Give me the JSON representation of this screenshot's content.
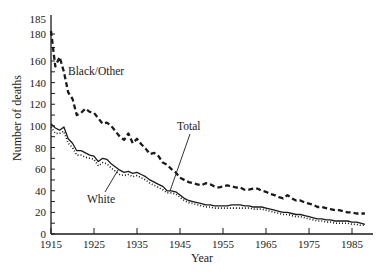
{
  "chart_data": {
    "type": "line",
    "title": "",
    "xlabel": "Year",
    "ylabel": "Number of deaths",
    "xlim": [
      1915,
      1990
    ],
    "ylim": [
      0,
      185
    ],
    "x_ticks": [
      1915,
      1925,
      1935,
      1945,
      1955,
      1965,
      1975,
      1985
    ],
    "y_ticks": [
      0,
      20,
      40,
      60,
      80,
      100,
      120,
      140,
      160,
      180,
      185
    ],
    "y_minor_step": 10,
    "grid": false,
    "legend": "none (series labelled directly)",
    "x": [
      1915,
      1916,
      1917,
      1918,
      1919,
      1920,
      1921,
      1922,
      1923,
      1924,
      1925,
      1926,
      1927,
      1928,
      1929,
      1930,
      1931,
      1932,
      1933,
      1934,
      1935,
      1936,
      1937,
      1938,
      1939,
      1940,
      1941,
      1942,
      1943,
      1944,
      1945,
      1946,
      1947,
      1948,
      1949,
      1950,
      1951,
      1952,
      1953,
      1954,
      1955,
      1956,
      1957,
      1958,
      1959,
      1960,
      1961,
      1962,
      1963,
      1964,
      1965,
      1966,
      1967,
      1968,
      1969,
      1970,
      1971,
      1972,
      1973,
      1974,
      1975,
      1976,
      1977,
      1978,
      1979,
      1980,
      1981,
      1982,
      1983,
      1984,
      1985,
      1986,
      1987,
      1988
    ],
    "series": [
      {
        "name": "Black/Other",
        "style": "dashed",
        "values": [
          181,
          155,
          163,
          150,
          131,
          125,
          110,
          112,
          116,
          113,
          112,
          107,
          102,
          103,
          100,
          95,
          90,
          87,
          93,
          84,
          88,
          83,
          79,
          74,
          75,
          72,
          66,
          64,
          60,
          57,
          52,
          50,
          48,
          47,
          46,
          45,
          47,
          46,
          44,
          43,
          44,
          45,
          44,
          43,
          43,
          41,
          41,
          42,
          42,
          40,
          39,
          37,
          36,
          34,
          33,
          36,
          33,
          31,
          31,
          29,
          28,
          27,
          25,
          25,
          24,
          23,
          22,
          22,
          21,
          20,
          20,
          19,
          19,
          19
        ]
      },
      {
        "name": "Total",
        "style": "solid",
        "values": [
          102,
          98,
          96,
          99,
          88,
          84,
          77,
          77,
          75,
          73,
          72,
          67,
          70,
          69,
          65,
          62,
          59,
          57,
          58,
          56,
          57,
          55,
          53,
          50,
          48,
          46,
          44,
          40,
          40,
          39,
          36,
          33,
          31,
          30,
          29,
          28,
          27,
          27,
          26,
          26,
          26,
          26,
          27,
          27,
          27,
          26,
          26,
          25,
          25,
          25,
          24,
          23,
          22,
          21,
          20,
          20,
          19,
          18,
          18,
          17,
          16,
          15,
          14,
          14,
          13,
          13,
          12,
          12,
          12,
          12,
          11,
          11,
          10,
          9
        ]
      },
      {
        "name": "White",
        "style": "dotted",
        "values": [
          99,
          93,
          93,
          95,
          84,
          80,
          73,
          73,
          71,
          70,
          69,
          63,
          66,
          65,
          61,
          58,
          55,
          54,
          55,
          53,
          54,
          52,
          50,
          47,
          45,
          43,
          41,
          38,
          38,
          37,
          34,
          31,
          29,
          28,
          27,
          26,
          25,
          25,
          24,
          24,
          24,
          24,
          24,
          24,
          24,
          24,
          24,
          23,
          23,
          23,
          22,
          21,
          20,
          19,
          18,
          18,
          17,
          16,
          16,
          15,
          14,
          13,
          12,
          12,
          11,
          11,
          10,
          10,
          10,
          10,
          9,
          9,
          8,
          8
        ]
      }
    ],
    "annotations": [
      {
        "text": "Black/Other",
        "series": "Black/Other"
      },
      {
        "text": "Total",
        "series": "Total"
      },
      {
        "text": "White",
        "series": "White"
      }
    ],
    "line_color": "#1a1a1a"
  }
}
